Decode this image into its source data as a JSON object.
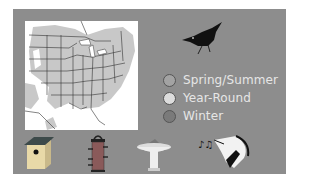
{
  "colors": {
    "panel": "#8d8d8d",
    "map_background": "#ffffff",
    "range_fill": "#c8c8c8",
    "legend_text": "#e6e6e6"
  },
  "map": {
    "name": "range-map-eastern-north-america"
  },
  "bird": {
    "name": "nuthatch-silhouette"
  },
  "legend": {
    "items": [
      {
        "label": "Spring/Summer",
        "color": "#a3a3a3"
      },
      {
        "label": "Year-Round",
        "color": "#dcdcdc"
      },
      {
        "label": "Winter",
        "color": "#7a7a7a"
      }
    ]
  },
  "icons": [
    {
      "name": "birdhouse-icon",
      "meaning": "nest box"
    },
    {
      "name": "tube-feeder-icon",
      "meaning": "feeder"
    },
    {
      "name": "birdbath-icon",
      "meaning": "bird bath"
    },
    {
      "name": "bird-song-icon",
      "meaning": "song"
    }
  ]
}
